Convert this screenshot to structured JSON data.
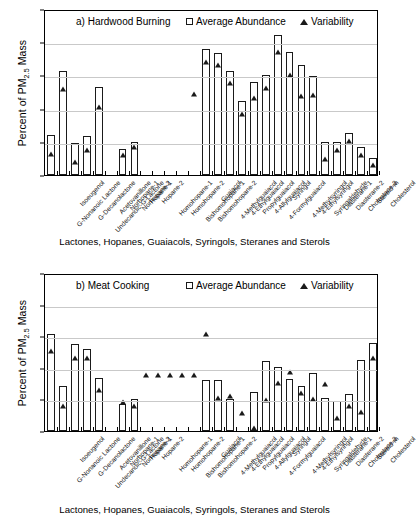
{
  "figure": {
    "y_axis_title": "Percent of PM",
    "y_axis_title_sub": "2.5",
    "y_axis_title_tail": " Mass",
    "x_caption": "Lactones, Hopanes, Guaiacols, Syringols, Steranes and Sterols",
    "legend": {
      "average_label": "Average Abundance",
      "variability_label": "Variability",
      "bar_marker": "open-square",
      "point_marker": "filled-triangle"
    },
    "y_tick_labels": [
      "10",
      "1",
      "0.1",
      "0.01",
      "0.001",
      "0.0001"
    ],
    "categories": [
      "G-Nonanoic Lactone",
      "Isoeugenol",
      "G-Decanolactone",
      "Undecanoic-G-Lactone",
      "Acetovanillone",
      "Norhopane-1",
      "Norhopane-2",
      "Hopane-1",
      "Hopane-2",
      "Homohopane-1",
      "Homohopane-2",
      "Bishomohopane-1",
      "Bishomohopane-2",
      "Guaiacol",
      "4-Methylguaiacol",
      "4-Ethylguaiacol",
      "Propylguaiacol",
      "4-Allylguaiacol",
      "4-Formylguaiacol",
      "Syringol",
      "4-Methylsyringol",
      "4-Ethylsyringol",
      "Syringaldehyde",
      "Diasterane-1",
      "Diasterane-2",
      "Cholestane-3",
      "Steroid-m",
      "Cholesterol"
    ]
  },
  "chart_data": [
    {
      "type": "bar",
      "id": "panel-a",
      "title": "a) Hardwood Burning",
      "ylabel": "Percent of PM2.5 Mass",
      "xlabel": "Lactones, Hopanes, Guaiacols, Syringols, Steranes and Sterols",
      "yscale": "log",
      "ylim": [
        0.0001,
        10
      ],
      "yticks": [
        0.0001,
        0.001,
        0.01,
        0.1,
        1,
        10
      ],
      "grid": true,
      "legend_position": "top-inside",
      "categories": [
        "G-Nonanoic Lactone",
        "Isoeugenol",
        "G-Decanolactone",
        "Undecanoic-G-Lactone",
        "Acetovanillone",
        "Norhopane-1",
        "Norhopane-2",
        "Hopane-1",
        "Hopane-2",
        "Homohopane-1",
        "Homohopane-2",
        "Bishomohopane-1",
        "Bishomohopane-2",
        "Guaiacol",
        "4-Methylguaiacol",
        "4-Ethylguaiacol",
        "Propylguaiacol",
        "4-Allylguaiacol",
        "4-Formylguaiacol",
        "Syringol",
        "4-Methylsyringol",
        "4-Ethylsyringol",
        "Syringaldehyde",
        "Diasterane-1",
        "Diasterane-2",
        "Cholestane-3",
        "Steroid-m",
        "Cholesterol"
      ],
      "series": [
        {
          "name": "Average Abundance",
          "marker": "open-square",
          "values": [
            0.0016,
            0.14,
            0.0009,
            0.0015,
            0.045,
            null,
            0.0006,
            0.001,
            null,
            null,
            null,
            null,
            null,
            0.62,
            0.48,
            0.14,
            0.017,
            0.062,
            0.105,
            1.7,
            0.5,
            0.2,
            0.098,
            0.001,
            0.001,
            0.0018,
            0.0007,
            0.00032
          ]
        },
        {
          "name": "Variability",
          "marker": "filled-triangle",
          "values": [
            0.0007,
            0.065,
            0.0004,
            0.00095,
            0.018,
            null,
            0.00065,
            0.0011,
            null,
            null,
            null,
            null,
            0.044,
            0.42,
            0.33,
            0.095,
            0.011,
            0.034,
            0.066,
            0.83,
            0.17,
            0.038,
            0.042,
            0.0005,
            0.00095,
            0.0017,
            0.00065,
            0.00032
          ]
        }
      ]
    },
    {
      "type": "bar",
      "id": "panel-b",
      "title": "b) Meat Cooking",
      "ylabel": "Percent of PM2.5 Mass",
      "xlabel": "Lactones, Hopanes, Guaiacols, Syringols, Steranes and Sterols",
      "yscale": "log",
      "ylim": [
        0.0001,
        10
      ],
      "yticks": [
        0.0001,
        0.001,
        0.01,
        0.1,
        1,
        10
      ],
      "grid": true,
      "legend_position": "top-inside",
      "categories": [
        "G-Nonanoic Lactone",
        "Isoeugenol",
        "G-Decanolactone",
        "Undecanoic-G-Lactone",
        "Acetovanillone",
        "Norhopane-1",
        "Norhopane-2",
        "Hopane-1",
        "Hopane-2",
        "Homohopane-1",
        "Homohopane-2",
        "Bishomohopane-1",
        "Bishomohopane-2",
        "Guaiacol",
        "4-Methylguaiacol",
        "4-Ethylguaiacol",
        "Propylguaiacol",
        "4-Allylguaiacol",
        "4-Formylguaiacol",
        "Syringol",
        "4-Methylsyringol",
        "4-Ethylsyringol",
        "Syringaldehyde",
        "Diasterane-1",
        "Diasterane-2",
        "Cholestane-3",
        "Steroid-m",
        "Cholesterol"
      ],
      "series": [
        {
          "name": "Average Abundance",
          "marker": "open-square",
          "values": [
            0.12,
            0.0027,
            0.055,
            0.04,
            0.0046,
            null,
            0.0007,
            0.00105,
            null,
            null,
            null,
            null,
            null,
            0.004,
            0.004,
            0.00103,
            null,
            0.0017,
            0.017,
            0.0105,
            0.0043,
            0.0027,
            0.007,
            0.00112,
            0.00087,
            0.00147,
            0.018,
            0.062
          ]
        },
        {
          "name": "Variability",
          "marker": "filled-triangle",
          "values": [
            0.055,
            0.001,
            0.035,
            0.034,
            0.0032,
            null,
            0.0014,
            0.00105,
            0.0098,
            0.0098,
            0.0098,
            0.0098,
            0.0098,
            0.19,
            0.0018,
            0.0022,
            0.0006,
            0.0002,
            0.0016,
            0.0055,
            0.0125,
            0.0026,
            0.0017,
            0.005,
            0.00042,
            0.00105,
            0.00068,
            0.035,
            0.065
          ]
        }
      ]
    }
  ]
}
